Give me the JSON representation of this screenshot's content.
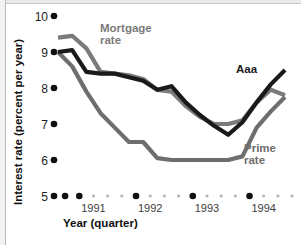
{
  "figure": {
    "width": 301,
    "height": 245,
    "background": "#ffffff"
  },
  "axis_titles": {
    "y": "Interest rate (percent per year)",
    "x": "Year (quarter)"
  },
  "colors": {
    "aaa": "#1a1a1a",
    "mortgage": "#7b7b7b",
    "prime": "#6e6e6e",
    "tick_major": "#111111",
    "tick_minor": "#b6b6b6",
    "text": "#1d1d1d",
    "frame": "#b9b9b9"
  },
  "series_labels": {
    "mortgage": {
      "line1": "Mortgage",
      "line2": "rate"
    },
    "aaa": {
      "line1": "Aaa",
      "line2": ""
    },
    "prime": {
      "line1": "Prime",
      "line2": "rate"
    }
  },
  "chart_data": {
    "type": "line",
    "title": "",
    "xlabel": "Year (quarter)",
    "ylabel": "Interest rate (percent per year)",
    "ylim": [
      5,
      10
    ],
    "yticks": [
      5,
      6,
      7,
      8,
      9,
      10
    ],
    "ytick_labels": [
      "5",
      "6",
      "7",
      "8",
      "9",
      "10"
    ],
    "grid": false,
    "legend": "inline-annotations",
    "x": [
      "1990Q4",
      "1991Q1",
      "1991Q2",
      "1991Q3",
      "1991Q4",
      "1992Q1",
      "1992Q2",
      "1992Q3",
      "1992Q4",
      "1993Q1",
      "1993Q2",
      "1993Q3",
      "1993Q4",
      "1994Q1",
      "1994Q2",
      "1994Q3",
      "1994Q4"
    ],
    "xtick_labels": [
      "1991",
      "1992",
      "1993",
      "1994"
    ],
    "xtick_label_positions": [
      2.5,
      6.5,
      10.5,
      14.5
    ],
    "x_major_ticks": [
      0.5,
      1.5,
      5.5,
      9.5,
      13.5
    ],
    "x_minor_ticks": [
      2.5,
      3.5,
      4.5,
      6.5,
      7.5,
      8.5,
      10.5,
      11.5,
      12.5,
      14.5,
      15.5,
      16.5
    ],
    "series": [
      {
        "name": "Mortgage rate",
        "color": "#7b7b7b",
        "values": [
          9.4,
          9.45,
          9.1,
          8.45,
          8.4,
          8.35,
          8.25,
          7.95,
          7.9,
          7.5,
          7.2,
          7.0,
          7.0,
          7.1,
          7.6,
          7.95,
          7.8
        ]
      },
      {
        "name": "Aaa",
        "color": "#1a1a1a",
        "values": [
          9.0,
          9.05,
          8.45,
          8.4,
          8.4,
          8.3,
          8.2,
          7.95,
          8.05,
          7.6,
          7.25,
          6.95,
          6.7,
          7.05,
          7.6,
          8.1,
          8.5
        ]
      },
      {
        "name": "Prime rate",
        "color": "#6e6e6e",
        "values": [
          9.0,
          8.6,
          7.9,
          7.3,
          6.9,
          6.5,
          6.5,
          6.05,
          6.0,
          6.0,
          6.0,
          6.0,
          6.0,
          6.1,
          6.9,
          7.35,
          7.75
        ]
      }
    ]
  },
  "annotation_positions": {
    "mortgage": {
      "x": 100,
      "y": 32
    },
    "aaa": {
      "x": 236,
      "y": 73
    },
    "prime": {
      "x": 244,
      "y": 152
    }
  }
}
